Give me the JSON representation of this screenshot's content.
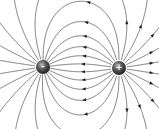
{
  "diagram": {
    "charges": [
      {
        "sign": "-",
        "x": 43,
        "y": 67,
        "r": 7
      },
      {
        "sign": "+",
        "x": 119,
        "y": 68,
        "r": 7
      }
    ],
    "line_color": "#5a5a5a",
    "charge_color": "#3a3a3a",
    "arrow_direction": "toward negative charge"
  }
}
